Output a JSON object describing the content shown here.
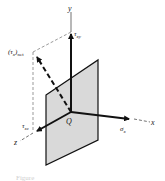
{
  "diagram": {
    "type": "stress-element-3d",
    "axes": {
      "x": "x",
      "y": "y",
      "z": "z"
    },
    "origin_label": "Q",
    "vectors": {
      "normal_stress": {
        "symbol": "σ",
        "subscript": "x"
      },
      "shear_xy": {
        "symbol": "τ",
        "subscript": "xy"
      },
      "shear_xz": {
        "symbol": "τ",
        "subscript": "xz"
      },
      "resultant_shear": {
        "symbol": "(τ",
        "subscript": "x",
        "suffix": ")",
        "suffix_sub": "net"
      }
    },
    "plane_fill": "#d9d9d9",
    "line_color": "#111111",
    "caption": "Figure"
  }
}
